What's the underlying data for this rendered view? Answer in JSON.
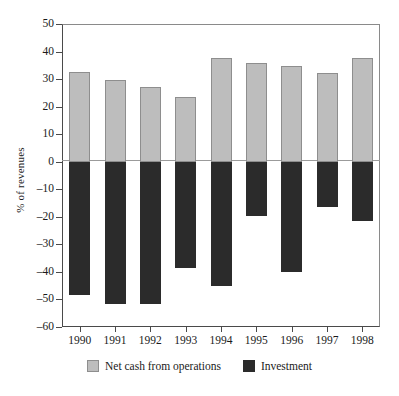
{
  "chart_data": {
    "type": "bar",
    "title": "",
    "subtitle": "",
    "xlabel": "",
    "ylabel": "% of revenues",
    "categories": [
      "1990",
      "1991",
      "1992",
      "1993",
      "1994",
      "1995",
      "1996",
      "1997",
      "1998"
    ],
    "series": [
      {
        "name": "Net cash from operations",
        "color": "#bdbdbd",
        "values": [
          32.4,
          29.8,
          27.0,
          23.5,
          37.8,
          35.8,
          34.6,
          32.2,
          37.8
        ]
      },
      {
        "name": "Investment",
        "color": "#2b2b2b",
        "values": [
          -48.5,
          -51.8,
          -51.8,
          -38.5,
          -45.0,
          -19.8,
          -40.0,
          -16.5,
          -21.5
        ]
      }
    ],
    "ylim": [
      -60,
      50
    ],
    "ytick_step": 10,
    "yticks": [
      "50",
      "40",
      "30",
      "20",
      "10",
      "0",
      "-10",
      "-20",
      "-30",
      "-40",
      "-50",
      "-60"
    ],
    "grid": false,
    "zero_line": true,
    "legend_position": "bottom",
    "stacked_from_zero": true
  },
  "legend": {
    "items": [
      {
        "label": "Net cash from operations",
        "swatch": "ops"
      },
      {
        "label": "Investment",
        "swatch": "inv"
      }
    ]
  }
}
